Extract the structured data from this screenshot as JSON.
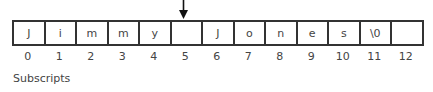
{
  "diagram": {
    "pointer_index": 5,
    "cells": [
      {
        "value": "J"
      },
      {
        "value": "i"
      },
      {
        "value": "m"
      },
      {
        "value": "m"
      },
      {
        "value": "y"
      },
      {
        "value": ""
      },
      {
        "value": "J"
      },
      {
        "value": "o"
      },
      {
        "value": "n"
      },
      {
        "value": "e"
      },
      {
        "value": "s"
      },
      {
        "value": "\\0"
      },
      {
        "value": ""
      }
    ],
    "subscripts": [
      "0",
      "1",
      "2",
      "3",
      "4",
      "5",
      "6",
      "7",
      "8",
      "9",
      "10",
      "11",
      "12"
    ],
    "caption": "Subscripts"
  }
}
